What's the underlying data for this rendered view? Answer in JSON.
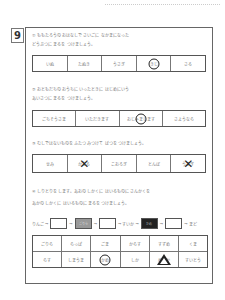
{
  "page_number": "9",
  "q1": {
    "line1": "① ももたろうの おはなしで さいごに なかまになった",
    "line2": "どうぶつに まるを つけましょう。",
    "options": [
      "いぬ",
      "たぬき",
      "うさぎ",
      "きじ",
      "さる"
    ]
  },
  "q2": {
    "line1": "② おともだちの おうちに いったときに はじめにいう",
    "line2": "あいさつに まるを つけましょう。",
    "options": [
      "ごちそうさま",
      "いただきます",
      "おじゃまします",
      "さようなら"
    ]
  },
  "q3": {
    "line1": "③ むしではないものを ふたつ みつけて ばつを つけましょう。",
    "options": [
      "せみ",
      "かえる",
      "こおろぎ",
      "とんぼ",
      "うさぎ"
    ]
  },
  "q4": {
    "line1": "④ しりとりを します。あおの しかくに はいるものに さんかくを",
    "line2": "あかの しかくに はいるものに まるを つけましょう。",
    "chain": {
      "start": "りんご",
      "gray_box": "ごりら",
      "middle": "すいか",
      "dark_box": "かめ",
      "end": "まど"
    },
    "grid_row1": [
      "ごりら",
      "らっぱ",
      "ごま",
      "からす",
      "すずめ",
      "くま"
    ],
    "grid_row2": [
      "らす",
      "しまうま",
      "かめ",
      "しか",
      "めだか",
      "すいとう"
    ]
  }
}
